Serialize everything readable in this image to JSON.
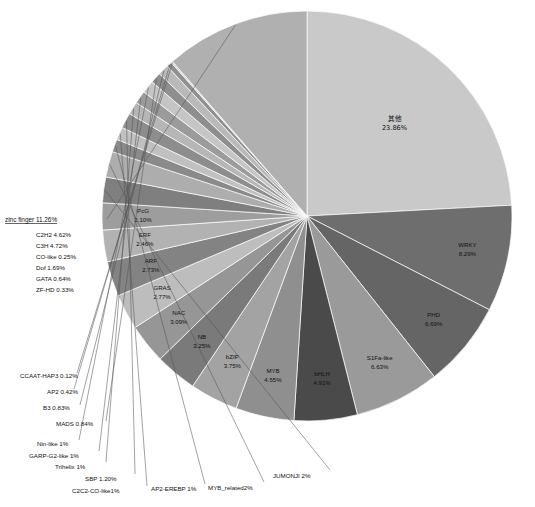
{
  "chart_data": {
    "type": "pie",
    "title": "",
    "subtitle": "",
    "xlabel": "",
    "ylabel": "",
    "legend_position": "none",
    "grid": false,
    "start_angle_deg": 0,
    "direction": "clockwise",
    "categories": [
      "其他",
      "WRKY",
      "PHD",
      "S1Fa-like",
      "bHLH",
      "MYB",
      "bZIP",
      "NB",
      "NAC",
      "GRAS",
      "ARF",
      "ERF",
      "PcG",
      "JUMONJI",
      "MYB_related",
      "AP2-EREBP",
      "C2C2-CO-like",
      "SBP",
      "Trihelix",
      "GARP-G2-like",
      "Nin-like",
      "MADS",
      "B3",
      "AP2",
      "CCAAT-HAP3",
      "zinc finger"
    ],
    "values": [
      23.86,
      8.29,
      6.69,
      6.63,
      4.91,
      4.55,
      3.75,
      3.25,
      3.09,
      2.77,
      2.73,
      2.46,
      2.1,
      2.0,
      2.0,
      1.0,
      1.0,
      1.2,
      1.0,
      1.0,
      1.0,
      0.84,
      0.83,
      0.42,
      0.12,
      11.26
    ],
    "slices": [
      {
        "label": "其他",
        "value_text": "23.86%",
        "value": 23.86,
        "label_type": "inner",
        "cjk": true,
        "gray": "#c9c9c9"
      },
      {
        "label": "WRKY",
        "value_text": "8.29%",
        "value": 8.29,
        "label_type": "inner",
        "cjk": false,
        "gray": "#6e6e6e"
      },
      {
        "label": "PHD",
        "value_text": "6.69%",
        "value": 6.69,
        "label_type": "inner",
        "cjk": false,
        "gray": "#656565"
      },
      {
        "label": "S1Fa-like",
        "value_text": "6.63%",
        "value": 6.63,
        "label_type": "inner",
        "cjk": false,
        "gray": "#9a9a9a"
      },
      {
        "label": "bHLH",
        "value_text": "4.91%",
        "value": 4.91,
        "label_type": "inner",
        "cjk": false,
        "gray": "#4a4a4a"
      },
      {
        "label": "MYB",
        "value_text": "4.55%",
        "value": 4.55,
        "label_type": "inner",
        "cjk": false,
        "gray": "#8f8f8f"
      },
      {
        "label": "bZIP",
        "value_text": "3.75%",
        "value": 3.75,
        "label_type": "inner",
        "cjk": false,
        "gray": "#a3a3a3"
      },
      {
        "label": "NB",
        "value_text": "3.25%",
        "value": 3.25,
        "label_type": "inner",
        "cjk": false,
        "gray": "#7a7a7a"
      },
      {
        "label": "NAC",
        "value_text": "3.09%",
        "value": 3.09,
        "label_type": "inner",
        "cjk": false,
        "gray": "#969696"
      },
      {
        "label": "GRAS",
        "value_text": "2.77%",
        "value": 2.77,
        "label_type": "inner",
        "cjk": false,
        "gray": "#bdbdbd"
      },
      {
        "label": "ARF",
        "value_text": "2.73%",
        "value": 2.73,
        "label_type": "inner",
        "cjk": false,
        "gray": "#838383"
      },
      {
        "label": "ERF",
        "value_text": "2.46%",
        "value": 2.46,
        "label_type": "inner",
        "cjk": false,
        "gray": "#b2b2b2"
      },
      {
        "label": "PcG",
        "value_text": "2.10%",
        "value": 2.1,
        "label_type": "inner",
        "cjk": false,
        "gray": "#9d9d9d"
      },
      {
        "label": "JUMONJI",
        "value_text": "2%",
        "value": 2.0,
        "label_type": "callout-bottom",
        "cjk": false,
        "gray": "#7f7f7f"
      },
      {
        "label": "MYB_related",
        "value_text": "2%",
        "value": 2.0,
        "label_type": "callout-bottom",
        "cjk": false,
        "gray": "#adadad"
      },
      {
        "label": "AP2-EREBP",
        "value_text": "1%",
        "value": 1.0,
        "label_type": "callout-bottom",
        "cjk": false,
        "gray": "#8a8a8a"
      },
      {
        "label": "C2C2-CO-like",
        "value_text": "1%",
        "value": 1.0,
        "label_type": "callout-bottom",
        "cjk": false,
        "gray": "#c0c0c0"
      },
      {
        "label": "SBP",
        "value_text": "1.20%",
        "value": 1.2,
        "label_type": "callout-bottom",
        "cjk": false,
        "gray": "#8d8d8d"
      },
      {
        "label": "Trihelix",
        "value_text": "1%",
        "value": 1.0,
        "label_type": "callout-bottom",
        "cjk": false,
        "gray": "#b6b6b6"
      },
      {
        "label": "GARP-G2-like",
        "value_text": "1%",
        "value": 1.0,
        "label_type": "callout-bottom",
        "cjk": false,
        "gray": "#9b9b9b"
      },
      {
        "label": "Nin-like",
        "value_text": "1%",
        "value": 1.0,
        "label_type": "callout-bottom",
        "cjk": false,
        "gray": "#c5c5c5"
      },
      {
        "label": "MADS",
        "value_text": "0.84%",
        "value": 0.84,
        "label_type": "callout-left",
        "cjk": false,
        "gray": "#8e8e8e"
      },
      {
        "label": "B3",
        "value_text": "0.83%",
        "value": 0.83,
        "label_type": "callout-left",
        "cjk": false,
        "gray": "#b9b9b9"
      },
      {
        "label": "AP2",
        "value_text": "0.42%",
        "value": 0.42,
        "label_type": "callout-left",
        "cjk": false,
        "gray": "#909090"
      },
      {
        "label": "CCAAT-HAP3",
        "value_text": "0.12%",
        "value": 0.12,
        "label_type": "callout-left",
        "cjk": false,
        "gray": "#cfcfcf"
      },
      {
        "label": "zinc finger",
        "value_text": "11.26%",
        "value": 11.26,
        "label_type": "callout-group",
        "cjk": false,
        "gray": "#b0b0b0"
      }
    ],
    "annotations": {
      "zinc_finger_group": {
        "title": "zinc finger 11.26%",
        "members": [
          {
            "label": "C2H2",
            "value_text": "4.62%",
            "value": 4.62
          },
          {
            "label": "C3H",
            "value_text": "4.72%",
            "value": 4.72
          },
          {
            "label": "CO-like",
            "value_text": "0.25%",
            "value": 0.25
          },
          {
            "label": "Dof",
            "value_text": "1.69%",
            "value": 1.69
          },
          {
            "label": "GATA",
            "value_text": "0.64%",
            "value": 0.64
          },
          {
            "label": "ZF-HD",
            "value_text": "0.33%",
            "value": 0.33
          }
        ]
      }
    },
    "colors": {
      "background": "#ffffff",
      "slice_border": "#ffffff",
      "text": "#111111",
      "leader_line": "#555555"
    }
  },
  "labels": {
    "other_name": "其他",
    "other_value": "23.86%",
    "wrky_name": "WRKY",
    "wrky_value": "8.29%",
    "phd_name": "PHD",
    "phd_value": "6.69%",
    "s1fa_name": "S1Fa-like",
    "s1fa_value": "6.63%",
    "bhlh_name": "bHLH",
    "bhlh_value": "4.91%",
    "myb_name": "MYB",
    "myb_value": "4.55%",
    "bzip_name": "bZIP",
    "bzip_value": "3.75%",
    "nb_name": "NB",
    "nb_value": "3.25%",
    "nac_name": "NAC",
    "nac_value": "3.09%",
    "gras_name": "GRAS",
    "gras_value": "2.77%",
    "arf_name": "ARF",
    "arf_value": "2.73%",
    "erf_name": "ERF",
    "erf_value": "2.46%",
    "pcg_name": "PcG",
    "pcg_value": "2.10%",
    "jumonji": "JUMONJI 2%",
    "myb_related": "MYB_related2%",
    "ap2_erebp": "AP2-EREBP 1%",
    "c2c2_co_like": "C2C2-CO-like1%",
    "sbp": "SBP 1.20%",
    "trihelix": "Trihelix 1%",
    "garp_g2_like": "GARP-G2-like 1%",
    "nin_like": "Nin-like 1%",
    "mads": "MADS 0.84%",
    "b3": "B3 0.83%",
    "ap2": "AP2 0.42%",
    "ccaat_hap3": "CCAAT-HAP3 0.12%",
    "zinc_finger_title": "zinc finger 11.26%",
    "zf_c2h2": "C2H2 4.62%",
    "zf_c3h": "C3H 4.72%",
    "zf_co_like": "CO-like 0.25%",
    "zf_dof": "Dof 1.69%",
    "zf_gata": "GATA 0.64%",
    "zf_zfhd": "ZF-HD 0.33%"
  }
}
